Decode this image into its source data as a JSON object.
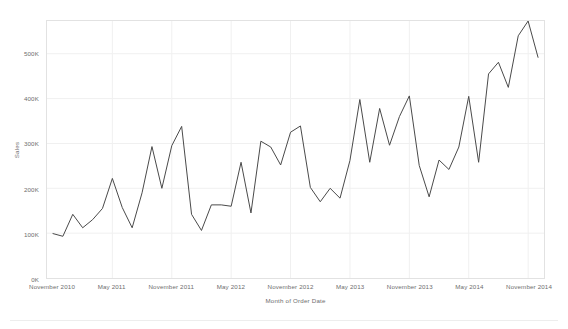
{
  "chart_data": {
    "type": "line",
    "title": "",
    "xlabel": "Month of Order Date",
    "ylabel": "Sales",
    "ylim": [
      0,
      573000
    ],
    "grid": true,
    "legend": false,
    "line_color": "#4a4a4a",
    "grid_color": "#f0f0f0",
    "axis_label_color": "#6e6e6e",
    "y_ticks": [
      {
        "value": 0,
        "label": "0K"
      },
      {
        "value": 100000,
        "label": "100K"
      },
      {
        "value": 200000,
        "label": "200K"
      },
      {
        "value": 300000,
        "label": "300K"
      },
      {
        "value": 400000,
        "label": "400K"
      },
      {
        "value": 500000,
        "label": "500K"
      }
    ],
    "x_tick_labels": [
      "November 2010",
      "May 2011",
      "November 2011",
      "May 2012",
      "November 2012",
      "May 2013",
      "November 2013",
      "May 2014",
      "November 2014"
    ],
    "x_tick_indices": [
      0,
      6,
      12,
      18,
      24,
      30,
      36,
      42,
      48
    ],
    "categories": [
      "November 2010",
      "December 2010",
      "January 2011",
      "February 2011",
      "March 2011",
      "April 2011",
      "May 2011",
      "June 2011",
      "July 2011",
      "August 2011",
      "September 2011",
      "October 2011",
      "November 2011",
      "December 2011",
      "January 2012",
      "February 2012",
      "March 2012",
      "April 2012",
      "May 2012",
      "June 2012",
      "July 2012",
      "August 2012",
      "September 2012",
      "October 2012",
      "November 2012",
      "December 2012",
      "January 2013",
      "February 2013",
      "March 2013",
      "April 2013",
      "May 2013",
      "June 2013",
      "July 2013",
      "August 2013",
      "September 2013",
      "October 2013",
      "November 2013",
      "December 2013",
      "January 2014",
      "February 2014",
      "March 2014",
      "April 2014",
      "May 2014",
      "June 2014",
      "July 2014",
      "August 2014",
      "September 2014",
      "October 2014",
      "November 2014",
      "December 2014"
    ],
    "values": [
      99000,
      93000,
      142000,
      112000,
      130000,
      155000,
      222000,
      157000,
      112000,
      190000,
      293000,
      200000,
      295000,
      338000,
      142000,
      106000,
      163000,
      163000,
      160000,
      258000,
      145000,
      305000,
      292000,
      252000,
      325000,
      339000,
      202000,
      170000,
      200000,
      178000,
      262000,
      398000,
      258000,
      378000,
      296000,
      360000,
      406000,
      251000,
      181000,
      263000,
      242000,
      292000,
      405000,
      258000,
      455000,
      481000,
      425000,
      540000,
      573000,
      492000
    ]
  }
}
